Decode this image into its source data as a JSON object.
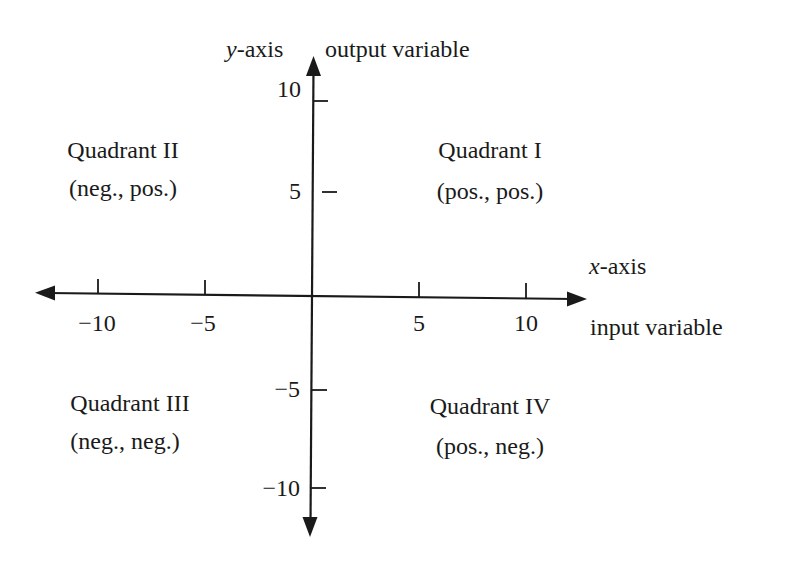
{
  "diagram": {
    "y_axis": {
      "name": "y-axis",
      "name_italic_part": "y",
      "name_rest": "-axis",
      "description": "output variable",
      "ticks": [
        {
          "value": 10,
          "label": "10"
        },
        {
          "value": 5,
          "label": "5"
        },
        {
          "value": -5,
          "label": "−5"
        },
        {
          "value": -10,
          "label": "−10"
        }
      ]
    },
    "x_axis": {
      "name": "x-axis",
      "name_italic_part": "x",
      "name_rest": "-axis",
      "description": "input variable",
      "ticks": [
        {
          "value": -10,
          "label": "−10"
        },
        {
          "value": -5,
          "label": "−5"
        },
        {
          "value": 5,
          "label": "5"
        },
        {
          "value": 10,
          "label": "10"
        }
      ]
    },
    "quadrants": [
      {
        "id": "I",
        "title": "Quadrant I",
        "signs": "(pos., pos.)"
      },
      {
        "id": "II",
        "title": "Quadrant II",
        "signs": "(neg., pos.)"
      },
      {
        "id": "III",
        "title": "Quadrant III",
        "signs": "(neg., neg.)"
      },
      {
        "id": "IV",
        "title": "Quadrant IV",
        "signs": "(pos., neg.)"
      }
    ],
    "colors": {
      "ink": "#1a1a1a",
      "background": "#ffffff"
    }
  }
}
